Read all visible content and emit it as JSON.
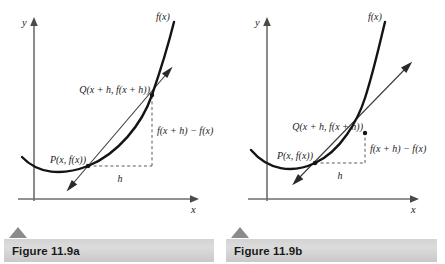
{
  "figures": [
    {
      "id": "figure-a",
      "caption": "Figure 11.9a",
      "axes": {
        "x_label": "x",
        "y_label": "y"
      },
      "labels": {
        "curve": "f(x)",
        "point_q": "Q(x + h, f(x + h))",
        "point_p": "P(x, f(x))",
        "rise": "f(x + h) − f(x)",
        "run": "h"
      },
      "colors": {
        "curve": "#141414",
        "secant": "#3a3a3a",
        "axis": "#6e6e6e",
        "dashed": "#5a5a5a",
        "caption_bar": "#d3d3d3",
        "caption_marker": "#8b8b8b"
      }
    },
    {
      "id": "figure-b",
      "caption": "Figure 11.9b",
      "axes": {
        "x_label": "x",
        "y_label": "y"
      },
      "labels": {
        "curve": "f(x)",
        "point_q": "Q(x + h, f(x + h))",
        "point_p": "P(x, f(x))",
        "rise": "f(x + h) − f(x)",
        "run": "h"
      },
      "colors": {
        "curve": "#141414",
        "secant": "#3a3a3a",
        "axis": "#6e6e6e",
        "dashed": "#5a5a5a",
        "caption_bar": "#d3d3d3",
        "caption_marker": "#8b8b8b"
      }
    }
  ]
}
